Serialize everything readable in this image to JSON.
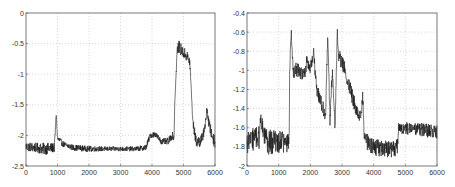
{
  "chart_data": [
    {
      "type": "line",
      "title": "",
      "xlabel": "",
      "ylabel": "",
      "xlim": [
        0,
        6000
      ],
      "ylim": [
        -2.5,
        0
      ],
      "grid": true,
      "legend": null,
      "xticks": [
        0,
        1000,
        2000,
        3000,
        4000,
        5000,
        6000
      ],
      "xtick_labels": [
        "0",
        "1000",
        "2000",
        "3000",
        "4000",
        "5000",
        "6000"
      ],
      "yticks": [
        0,
        -0.5,
        -1,
        -1.5,
        -2,
        -2.5
      ],
      "ytick_labels": [
        "0",
        "-0.5",
        "-1",
        "-1.5",
        "-2",
        "-2.5"
      ],
      "series": [
        {
          "name": "signal",
          "color": "#1a1a1a",
          "x": [
            0,
            300,
            600,
            900,
            960,
            1000,
            1200,
            1500,
            2000,
            2500,
            3000,
            3500,
            3800,
            3950,
            4100,
            4300,
            4500,
            4650,
            4700,
            4720,
            4800,
            4850,
            5000,
            5100,
            5200,
            5250,
            5300,
            5400,
            5500,
            5600,
            5650,
            5700,
            5750,
            5800,
            5900,
            6000
          ],
          "y": [
            -2.18,
            -2.2,
            -2.22,
            -2.2,
            -1.65,
            -2.05,
            -2.15,
            -2.2,
            -2.22,
            -2.22,
            -2.22,
            -2.22,
            -2.2,
            -2.0,
            -1.98,
            -2.1,
            -2.1,
            -2.0,
            -2.05,
            -1.5,
            -0.6,
            -0.55,
            -0.65,
            -0.7,
            -0.8,
            -1.3,
            -1.8,
            -2.1,
            -2.1,
            -2.05,
            -1.9,
            -1.8,
            -1.55,
            -1.8,
            -2.0,
            -2.1
          ],
          "noise": [
            0.08,
            0.08,
            0.1,
            0.08,
            0.05,
            0.06,
            0.05,
            0.05,
            0.05,
            0.04,
            0.04,
            0.04,
            0.05,
            0.05,
            0.05,
            0.05,
            0.06,
            0.06,
            0.04,
            0.04,
            0.08,
            0.1,
            0.1,
            0.1,
            0.08,
            0.05,
            0.08,
            0.1,
            0.1,
            0.1,
            0.1,
            0.08,
            0.08,
            0.1,
            0.1,
            0.12
          ]
        }
      ]
    },
    {
      "type": "line",
      "title": "",
      "xlabel": "",
      "ylabel": "",
      "xlim": [
        0,
        6000
      ],
      "ylim": [
        -2,
        -0.4
      ],
      "grid": true,
      "legend": null,
      "xticks": [
        0,
        1000,
        2000,
        3000,
        4000,
        5000,
        6000
      ],
      "xtick_labels": [
        "0",
        "1000",
        "2000",
        "3000",
        "4000",
        "5000",
        "6000"
      ],
      "yticks": [
        -0.4,
        -0.6,
        -0.8,
        -1,
        -1.2,
        -1.4,
        -1.6,
        -1.8,
        -2
      ],
      "ytick_labels": [
        "-0.4",
        "-0.6",
        "-0.8",
        "-1",
        "-1.2",
        "-1.4",
        "-1.6",
        "-1.8",
        "-2"
      ],
      "series": [
        {
          "name": "signal",
          "color": "#1a1a1a",
          "x": [
            0,
            200,
            400,
            420,
            600,
            900,
            1200,
            1330,
            1350,
            1400,
            1450,
            1600,
            1800,
            1900,
            2000,
            2100,
            2200,
            2400,
            2480,
            2550,
            2620,
            2700,
            2780,
            2850,
            2900,
            3100,
            3300,
            3500,
            3600,
            3650,
            3700,
            3800,
            4000,
            4300,
            4600,
            4750,
            4780,
            5000,
            5500,
            6000
          ],
          "y": [
            -1.75,
            -1.72,
            -1.7,
            -1.5,
            -1.75,
            -1.75,
            -1.75,
            -1.75,
            -0.95,
            -0.6,
            -1.0,
            -1.0,
            -1.05,
            -0.9,
            -1.0,
            -0.8,
            -1.2,
            -1.4,
            -1.5,
            -0.6,
            -1.5,
            -1.0,
            -1.6,
            -0.6,
            -0.85,
            -1.0,
            -1.25,
            -1.45,
            -1.5,
            -1.25,
            -1.65,
            -1.75,
            -1.8,
            -1.82,
            -1.82,
            -1.8,
            -1.6,
            -1.6,
            -1.62,
            -1.65
          ],
          "noise": [
            0.12,
            0.12,
            0.12,
            0.06,
            0.14,
            0.12,
            0.12,
            0.1,
            0.08,
            0.05,
            0.08,
            0.08,
            0.08,
            0.08,
            0.08,
            0.06,
            0.08,
            0.08,
            0.06,
            0.06,
            0.08,
            0.06,
            0.06,
            0.05,
            0.08,
            0.08,
            0.08,
            0.08,
            0.06,
            0.06,
            0.08,
            0.09,
            0.09,
            0.09,
            0.09,
            0.09,
            0.07,
            0.07,
            0.07,
            0.08
          ]
        }
      ]
    }
  ],
  "charts": [
    {
      "id": "left",
      "box": {
        "left": 26,
        "top": 13,
        "right": 215,
        "bottom": 166
      }
    },
    {
      "id": "right",
      "box": {
        "left": 19,
        "top": 13,
        "right": 209,
        "bottom": 166
      }
    }
  ],
  "style": {
    "axis_color": "#555555",
    "grid_color": "#c8c8c8",
    "line_color": "#1a1a1a",
    "background": "#ffffff"
  }
}
